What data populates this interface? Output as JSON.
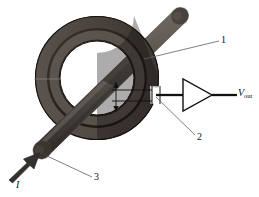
{
  "figure": {
    "background_color": "#ffffff",
    "width": 259,
    "height": 197
  },
  "colors": {
    "core_dark": "#2b2420",
    "core_mid": "#3a332e",
    "core_highlight": "#7a736c",
    "core_shadow": "#181412",
    "rod_gray": "#55504c",
    "rod_light": "#6e6862",
    "rod_dark": "#3c3733",
    "line_black": "#111111",
    "leader_gray": "#666666",
    "arrow_dark": "#33302d"
  },
  "labels": {
    "core_callout": "1",
    "gap_callout": "2",
    "conductor_callout": "3",
    "current_symbol": "I",
    "output_symbol": "V",
    "output_subscript": "out"
  },
  "components": {
    "core": {
      "name": "toroidal magnetic core",
      "callout": "1",
      "center_x": 97,
      "center_y": 78,
      "outer_radius": 62,
      "inner_radius": 37
    },
    "gap": {
      "name": "air gap with hall sensor",
      "callout": "2",
      "x": 152,
      "y": 95
    },
    "conductor": {
      "name": "current carrying conductor",
      "callout": "3",
      "from_x": 42,
      "from_y": 150,
      "to_x": 178,
      "to_y": 18
    },
    "amplifier": {
      "name": "amplifier",
      "apex_x": 212,
      "apex_y": 95,
      "base_x": 183,
      "top_y": 79,
      "bottom_y": 111
    },
    "output_node": {
      "name": "output terminal",
      "x": 236,
      "y": 95
    },
    "current_arrow": {
      "name": "input current arrow",
      "tail_x": 10,
      "tail_y": 178,
      "head_x": 42,
      "head_y": 152
    }
  }
}
